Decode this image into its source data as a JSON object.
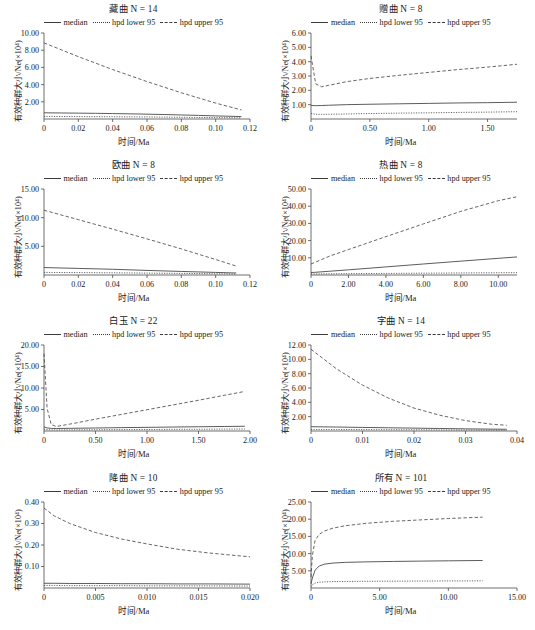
{
  "figure": {
    "axis_labels": {
      "x": "时间/Ma",
      "y": "有效种群大小/Ne(×10⁴)"
    },
    "legend": [
      {
        "label": "median",
        "style": "solid"
      },
      {
        "label": "hpd lower 95",
        "style": "dotted"
      },
      {
        "label": "hpd upper 95",
        "style": "dashed"
      }
    ]
  },
  "chart_data": [
    {
      "type": "line",
      "title": "藏曲 N = 14",
      "group": "藏曲",
      "n": 14,
      "xlabel": "时间/Ma",
      "ylabel": "有效种群大小/Ne(×10⁴)",
      "xlim": [
        0,
        0.12
      ],
      "ylim": [
        0,
        10.0
      ],
      "xticks": [
        0,
        0.02,
        0.04,
        0.06,
        0.08,
        0.1,
        0.12
      ],
      "xticklabels": [
        "0",
        "0.02",
        "0.04",
        "0.06",
        "0.08",
        "0.10",
        "0.12"
      ],
      "yticks": [
        2.0,
        4.0,
        6.0,
        8.0,
        10.0
      ],
      "yticklabels": [
        "2.00",
        "4.00",
        "6.00",
        "8.00",
        "10.00"
      ],
      "grid": false,
      "legend_position": "above-axes",
      "x": [
        0,
        0.01,
        0.02,
        0.03,
        0.04,
        0.05,
        0.06,
        0.07,
        0.08,
        0.09,
        0.1,
        0.115
      ],
      "series": [
        {
          "name": "median",
          "values": [
            0.72,
            0.7,
            0.68,
            0.66,
            0.63,
            0.6,
            0.56,
            0.52,
            0.47,
            0.42,
            0.36,
            0.28
          ]
        },
        {
          "name": "hpd lower 95",
          "values": [
            0.3,
            0.29,
            0.28,
            0.27,
            0.26,
            0.25,
            0.24,
            0.22,
            0.2,
            0.18,
            0.16,
            0.13
          ]
        },
        {
          "name": "hpd upper 95",
          "values": [
            8.85,
            8.05,
            7.25,
            6.5,
            5.75,
            5.05,
            4.35,
            3.7,
            3.05,
            2.45,
            1.85,
            1.05
          ]
        }
      ]
    },
    {
      "type": "line",
      "title": "赠曲 N = 8",
      "group": "赠曲",
      "n": 8,
      "xlabel": "时间/Ma",
      "ylabel": "有效种群大小/Ne(×10⁴)",
      "xlim": [
        0,
        1.75
      ],
      "ylim": [
        0,
        6.0
      ],
      "xticks": [
        0,
        0.5,
        1.0,
        1.5
      ],
      "xticklabels": [
        "0",
        "0.50",
        "1.00",
        "1.50"
      ],
      "yticks": [
        1.0,
        2.0,
        3.0,
        4.0,
        5.0,
        6.0
      ],
      "yticklabels": [
        "1.00",
        "2.00",
        "3.00",
        "4.00",
        "5.00",
        "6.00"
      ],
      "grid": false,
      "legend_position": "above-axes",
      "x": [
        0,
        0.04,
        0.09,
        0.15,
        0.3,
        0.5,
        0.75,
        1.0,
        1.25,
        1.5,
        1.75
      ],
      "series": [
        {
          "name": "median",
          "values": [
            0.95,
            0.93,
            0.94,
            0.96,
            1.0,
            1.03,
            1.06,
            1.09,
            1.12,
            1.14,
            1.17
          ]
        },
        {
          "name": "hpd lower 95",
          "values": [
            0.38,
            0.33,
            0.32,
            0.33,
            0.35,
            0.38,
            0.41,
            0.43,
            0.46,
            0.48,
            0.51
          ]
        },
        {
          "name": "hpd upper 95",
          "values": [
            4.4,
            2.45,
            2.25,
            2.35,
            2.6,
            2.83,
            3.05,
            3.25,
            3.45,
            3.62,
            3.82
          ]
        }
      ]
    },
    {
      "type": "line",
      "title": "欧曲 N = 8",
      "group": "欧曲",
      "n": 8,
      "xlabel": "时间/Ma",
      "ylabel": "有效种群大小/Ne(×10⁴)",
      "xlim": [
        0,
        0.12
      ],
      "ylim": [
        0,
        15.0
      ],
      "xticks": [
        0,
        0.02,
        0.04,
        0.06,
        0.08,
        0.1,
        0.12
      ],
      "xticklabels": [
        "0",
        "0.02",
        "0.04",
        "0.06",
        "0.08",
        "0.10",
        "0.12"
      ],
      "yticks": [
        5.0,
        10.0,
        15.0
      ],
      "yticklabels": [
        "5.00",
        "10.00",
        "15.00"
      ],
      "grid": false,
      "legend_position": "above-axes",
      "x": [
        0,
        0.02,
        0.04,
        0.06,
        0.08,
        0.1,
        0.112
      ],
      "series": [
        {
          "name": "median",
          "values": [
            1.3,
            1.15,
            1.0,
            0.8,
            0.62,
            0.45,
            0.35
          ]
        },
        {
          "name": "hpd lower 95",
          "values": [
            0.45,
            0.42,
            0.38,
            0.33,
            0.28,
            0.22,
            0.18
          ]
        },
        {
          "name": "hpd upper 95",
          "values": [
            11.3,
            9.65,
            8.0,
            6.3,
            4.55,
            2.7,
            1.55
          ]
        }
      ]
    },
    {
      "type": "line",
      "title": "热曲 N = 8",
      "group": "热曲",
      "n": 8,
      "xlabel": "时间/Ma",
      "ylabel": "有效种群大小/Ne(×10⁴)",
      "xlim": [
        0,
        11.0
      ],
      "ylim": [
        0,
        50.0
      ],
      "xticks": [
        0,
        2.0,
        4.0,
        6.0,
        8.0,
        10.0
      ],
      "xticklabels": [
        "0",
        "2.00",
        "4.00",
        "6.00",
        "8.00",
        "10.00"
      ],
      "yticks": [
        10.0,
        20.0,
        30.0,
        40.0,
        50.0
      ],
      "yticklabels": [
        "10.00",
        "20.00",
        "30.00",
        "40.00",
        "50.00"
      ],
      "grid": false,
      "legend_position": "above-axes",
      "x": [
        0,
        0.2,
        1.0,
        2.0,
        4.0,
        6.0,
        8.0,
        10.0,
        11.0
      ],
      "series": [
        {
          "name": "median",
          "values": [
            1.45,
            1.55,
            2.2,
            3.0,
            4.7,
            6.4,
            8.05,
            9.7,
            10.5
          ]
        },
        {
          "name": "hpd lower 95",
          "values": [
            0.6,
            0.62,
            0.7,
            0.78,
            0.92,
            1.05,
            1.18,
            1.3,
            1.36
          ]
        },
        {
          "name": "hpd upper 95",
          "values": [
            6.4,
            7.3,
            11.0,
            14.8,
            22.3,
            29.7,
            37.0,
            43.2,
            45.5
          ]
        }
      ]
    },
    {
      "type": "line",
      "title": "白玉 N = 22",
      "group": "白玉",
      "n": 22,
      "xlabel": "时间/Ma",
      "ylabel": "有效种群大小/Ne(×10⁴)",
      "xlim": [
        0,
        2.0
      ],
      "ylim": [
        0,
        20.0
      ],
      "xticks": [
        0,
        0.5,
        1.0,
        1.5,
        2.0
      ],
      "xticklabels": [
        "0",
        "0.50",
        "1.00",
        "1.50",
        "2.00"
      ],
      "yticks": [
        5.0,
        10.0,
        15.0,
        20.0
      ],
      "yticklabels": [
        "5.00",
        "10.00",
        "15.00",
        "20.00"
      ],
      "grid": false,
      "legend_position": "above-axes",
      "x": [
        0,
        0.03,
        0.07,
        0.12,
        0.25,
        0.5,
        0.75,
        1.0,
        1.25,
        1.5,
        1.75,
        1.95
      ],
      "series": [
        {
          "name": "median",
          "values": [
            0.95,
            0.72,
            0.6,
            0.58,
            0.62,
            0.7,
            0.78,
            0.85,
            0.92,
            0.99,
            1.05,
            1.1
          ]
        },
        {
          "name": "hpd lower 95",
          "values": [
            0.42,
            0.3,
            0.25,
            0.24,
            0.26,
            0.29,
            0.32,
            0.35,
            0.38,
            0.41,
            0.44,
            0.46
          ]
        },
        {
          "name": "hpd upper 95",
          "values": [
            18.0,
            5.3,
            1.5,
            1.05,
            1.6,
            2.75,
            3.85,
            4.95,
            6.05,
            7.15,
            8.3,
            9.2
          ]
        }
      ]
    },
    {
      "type": "line",
      "title": "字曲 N = 14",
      "group": "字曲",
      "n": 14,
      "xlabel": "时间/Ma",
      "ylabel": "有效种群大小/Ne(×10⁴)",
      "xlim": [
        0,
        0.04
      ],
      "ylim": [
        0,
        12.0
      ],
      "xticks": [
        0,
        0.01,
        0.02,
        0.03,
        0.04
      ],
      "xticklabels": [
        "0",
        "0.01",
        "0.02",
        "0.03",
        "0.04"
      ],
      "yticks": [
        2.0,
        4.0,
        6.0,
        8.0,
        10.0,
        12.0
      ],
      "yticklabels": [
        "2.00",
        "4.00",
        "6.00",
        "8.00",
        "10.00",
        "12.00"
      ],
      "grid": false,
      "legend_position": "above-axes",
      "x": [
        0,
        0.005,
        0.01,
        0.015,
        0.02,
        0.025,
        0.03,
        0.035,
        0.038
      ],
      "series": [
        {
          "name": "median",
          "values": [
            0.6,
            0.55,
            0.5,
            0.45,
            0.4,
            0.35,
            0.3,
            0.26,
            0.24
          ]
        },
        {
          "name": "hpd lower 95",
          "values": [
            0.22,
            0.21,
            0.2,
            0.18,
            0.17,
            0.15,
            0.14,
            0.12,
            0.11
          ]
        },
        {
          "name": "hpd upper 95",
          "values": [
            11.4,
            8.65,
            6.4,
            4.6,
            3.2,
            2.2,
            1.45,
            0.95,
            0.8
          ]
        }
      ]
    },
    {
      "type": "line",
      "title": "降曲 N = 10",
      "group": "降曲",
      "n": 10,
      "xlabel": "时间/Ma",
      "ylabel": "有效种群大小/Ne(×10⁴)",
      "xlim": [
        0,
        0.02
      ],
      "ylim": [
        0,
        0.4
      ],
      "xticks": [
        0,
        0.005,
        0.01,
        0.015,
        0.02
      ],
      "xticklabels": [
        "0",
        "0.005",
        "0.010",
        "0.015",
        "0.020"
      ],
      "yticks": [
        0.1,
        0.2,
        0.3,
        0.4
      ],
      "yticklabels": [
        "0.10",
        "0.20",
        "0.30",
        "0.40"
      ],
      "grid": false,
      "legend_position": "above-axes",
      "x": [
        0,
        0.001,
        0.0025,
        0.005,
        0.0075,
        0.01,
        0.013,
        0.016,
        0.02
      ],
      "series": [
        {
          "name": "median",
          "values": [
            0.022,
            0.022,
            0.021,
            0.021,
            0.02,
            0.02,
            0.019,
            0.019,
            0.018
          ]
        },
        {
          "name": "hpd lower 95",
          "values": [
            0.012,
            0.012,
            0.011,
            0.011,
            0.011,
            0.01,
            0.01,
            0.01,
            0.009
          ]
        },
        {
          "name": "hpd upper 95",
          "values": [
            0.372,
            0.335,
            0.3,
            0.258,
            0.228,
            0.205,
            0.18,
            0.163,
            0.145
          ]
        }
      ]
    },
    {
      "type": "line",
      "title": "所有 N = 101",
      "group": "所有",
      "n": 101,
      "xlabel": "时间/Ma",
      "ylabel": "有效种群大小/Ne(×10⁴)",
      "xlim": [
        0,
        15.0
      ],
      "ylim": [
        0,
        25.0
      ],
      "xticks": [
        0,
        5.0,
        10.0,
        15.0
      ],
      "xticklabels": [
        "0",
        "5.00",
        "10.00",
        "15.00"
      ],
      "yticks": [
        5.0,
        10.0,
        15.0,
        20.0,
        25.0
      ],
      "yticklabels": [
        "5.00",
        "10.00",
        "15.00",
        "20.00",
        "25.00"
      ],
      "grid": false,
      "legend_position": "above-axes",
      "x": [
        0,
        0.1,
        0.3,
        0.6,
        1.0,
        1.6,
        2.5,
        4.0,
        6.0,
        8.0,
        10.0,
        12.5
      ],
      "series": [
        {
          "name": "median",
          "values": [
            1.2,
            2.9,
            5.2,
            6.4,
            6.95,
            7.25,
            7.45,
            7.6,
            7.72,
            7.82,
            7.9,
            8.0
          ]
        },
        {
          "name": "hpd lower 95",
          "values": [
            0.4,
            0.95,
            1.45,
            1.68,
            1.78,
            1.85,
            1.9,
            1.95,
            1.99,
            2.02,
            2.05,
            2.08
          ]
        },
        {
          "name": "hpd upper 95",
          "values": [
            3.2,
            9.4,
            13.9,
            15.6,
            16.6,
            17.4,
            18.1,
            18.8,
            19.4,
            19.8,
            20.2,
            20.6
          ]
        }
      ]
    }
  ]
}
